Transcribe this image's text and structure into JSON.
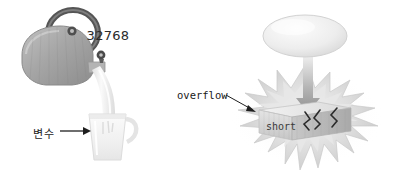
{
  "figure": {
    "background_color": "#ffffff",
    "width": 394,
    "height": 183
  },
  "left_panel": {
    "name": "kettle-pouring-into-glass-illustration",
    "caption": "변수",
    "caption_meaning_icon": "arrow-right-icon",
    "objects": [
      {
        "icon": "kettle-icon",
        "label": "",
        "color": "#a8a8a8"
      },
      {
        "icon": "kettle-ring-handle-icon",
        "label": "",
        "color": "#5a5a5a"
      },
      {
        "icon": "kettle-lid-knob-icon",
        "label": "",
        "color": "#4f4f4f"
      },
      {
        "icon": "kettle-spout-knob-icon",
        "label": "",
        "color": "#4f4f4f"
      },
      {
        "icon": "pouring-stream-icon",
        "label": "",
        "color": "#eeeeee"
      },
      {
        "icon": "glass-cup-icon",
        "label": "",
        "color": "#f2f2f2"
      }
    ]
  },
  "right_panel": {
    "name": "short-overflow-explosion-illustration",
    "bubble_value": "32768",
    "overflow_label": "overflow",
    "box_label": "short",
    "crack_marks": "cracks-icon",
    "arrow_down": "arrow-down-icon",
    "leader_line": "leader-line-arrow-icon"
  },
  "colors": {
    "kettle_body": "#a9a9a9",
    "kettle_handle": "#595959",
    "starburst": "#cfcfcf",
    "starburst_inner": "#e3e3e3",
    "box_front": "#d8d8d8",
    "box_top": "#eaeaea",
    "box_side": "#b9b9b9",
    "bubble": "#ececec",
    "text": "#1a1a1a",
    "arrow": "#9a9a9a"
  }
}
